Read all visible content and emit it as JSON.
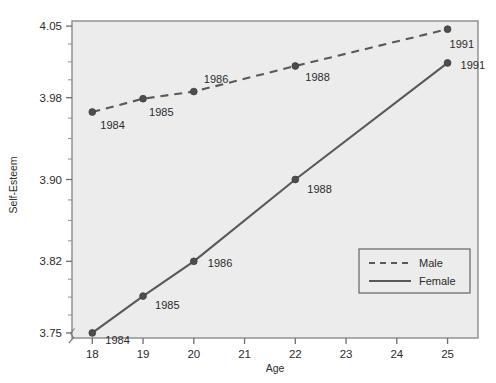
{
  "chart_data": {
    "type": "line",
    "title": "",
    "xlabel": "Age",
    "ylabel": "Self-Esteem",
    "xlim": [
      17.6,
      25.6
    ],
    "ylim": [
      3.745,
      4.055
    ],
    "xticks": [
      "18",
      "19",
      "20",
      "21",
      "22",
      "23",
      "24",
      "25"
    ],
    "xtick_values": [
      18,
      19,
      20,
      21,
      22,
      23,
      24,
      25
    ],
    "yticks": [
      "4.05",
      "3.98",
      "3.90",
      "3.82",
      "3.75"
    ],
    "ytick_values": [
      4.05,
      3.98,
      3.9,
      3.82,
      3.75
    ],
    "grid": false,
    "axis_break": true,
    "legend_position": "lower-right",
    "series": [
      {
        "name": "Male",
        "style": "dashed",
        "color": "#595959",
        "x": [
          18,
          19,
          20,
          22,
          25
        ],
        "values": [
          3.966,
          3.979,
          3.986,
          4.011,
          4.047
        ],
        "point_labels": [
          "1984",
          "1985",
          "1986",
          "1988",
          "1991"
        ]
      },
      {
        "name": "Female",
        "style": "solid",
        "color": "#595959",
        "x": [
          18,
          19,
          20,
          22,
          25
        ],
        "values": [
          3.75,
          3.786,
          3.82,
          3.9,
          4.014
        ],
        "point_labels": [
          "1984",
          "1985",
          "1986",
          "1988",
          "1991"
        ]
      }
    ]
  },
  "legend": {
    "items": [
      {
        "label": "Male"
      },
      {
        "label": "Female"
      }
    ]
  },
  "axes": {
    "x_title": "Age",
    "y_title": "Self-Esteem"
  },
  "colors": {
    "plot_background": "#ececec",
    "page_background": "#ffffff",
    "line": "#595959",
    "marker": "#4d4d4d",
    "frame": "#8c8c8c",
    "text": "#2b2b2b"
  }
}
